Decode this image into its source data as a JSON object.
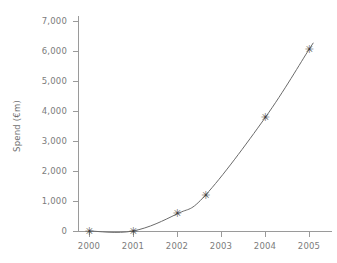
{
  "chart_data": {
    "type": "line",
    "title": "",
    "xlabel": "",
    "ylabel": "Spend (€m)",
    "xlim": [
      2000,
      2005
    ],
    "ylim": [
      0,
      7000
    ],
    "grid": false,
    "legend": "none",
    "marker": "asterisk",
    "line_style": "smooth",
    "x_ticks": [
      "2000",
      "2001",
      "2002",
      "2003",
      "2004",
      "2005"
    ],
    "x_tick_values": [
      2000,
      2001,
      2002,
      2003,
      2004,
      2005
    ],
    "y_ticks": [
      "0",
      "1,000",
      "2,000",
      "3,000",
      "4,000",
      "5,000",
      "6,000",
      "7,000"
    ],
    "y_tick_values": [
      0,
      1000,
      2000,
      3000,
      4000,
      5000,
      6000,
      7000
    ],
    "series": [
      {
        "name": "Spend",
        "x": [
          2000,
          2001,
          2002,
          2002.65,
          2004,
          2005
        ],
        "values": [
          0,
          0,
          570,
          1200,
          3770,
          6050
        ]
      }
    ],
    "points": [
      {
        "x": 2000,
        "y": 0,
        "label": "2000"
      },
      {
        "x": 2001,
        "y": 0,
        "label": "2001"
      },
      {
        "x": 2002,
        "y": 570,
        "label": "2002"
      },
      {
        "x": 2002.65,
        "y": 1200,
        "label": "2002.65"
      },
      {
        "x": 2004,
        "y": 3770,
        "label": "2004"
      },
      {
        "x": 2005,
        "y": 6050,
        "label": "2005"
      }
    ],
    "colors": {
      "line": "#6b6b6b",
      "marker": "#3f3f3f",
      "axis": "#9a9a9a",
      "tick_text": "#7c7c7c",
      "axis_title": "#6f6f6f",
      "background": "#ffffff"
    }
  },
  "axis": {
    "y_title": "Spend (€m)"
  },
  "markers": {
    "glyph": "✳"
  }
}
